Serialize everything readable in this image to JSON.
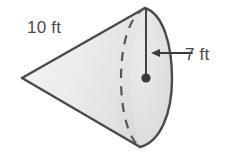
{
  "diagram": {
    "shape": "cone",
    "orientation": "apex-left-base-right",
    "labels": {
      "slant_height": "10 ft",
      "radius": "7 ft"
    },
    "colors": {
      "outline": "#4a4a4a",
      "fill": "#e8e8e8",
      "fill_highlight": "#f4f4f4",
      "fill_shadow": "#d8d8d8",
      "dashed_line": "#555555",
      "text": "#4a4a4a",
      "center_dot": "#3a3a3a",
      "background": "#ffffff"
    },
    "geometry": {
      "apex": {
        "x": 22,
        "y": 78
      },
      "base_center": {
        "x": 146,
        "y": 78
      },
      "base_top": {
        "x": 145,
        "y": 8
      },
      "base_bottom": {
        "x": 140,
        "y": 147
      },
      "base_right_extent": {
        "x": 171,
        "y": 78
      },
      "base_dashed_left_extent": {
        "x": 121,
        "y": 78
      },
      "radius_line": {
        "x1": 146,
        "y1": 10,
        "x2": 146,
        "y2": 78
      },
      "arrow": {
        "tail_x": 192,
        "tip_x": 152,
        "y": 53
      }
    }
  }
}
